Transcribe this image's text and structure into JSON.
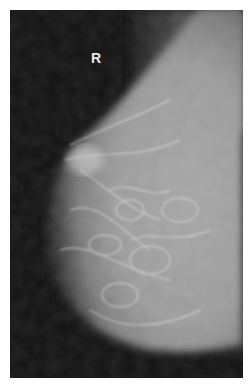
{
  "image": {
    "subject": "mammogram",
    "laterality_label": "R",
    "colors": {
      "background": "#111111",
      "tissue_bright": "#d8d8d8",
      "tissue_mid": "#9a9a9a",
      "border": "#ffffff"
    }
  }
}
